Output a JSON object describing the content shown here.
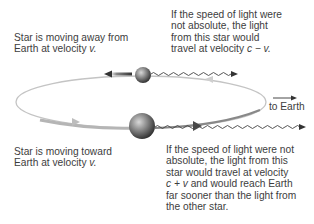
{
  "labels": {
    "away_line1": "Star is moving away from",
    "away_line2": "Earth at velocity ",
    "away_var": "v.",
    "toward_line1": "Star is moving toward",
    "toward_line2": "Earth at velocity ",
    "toward_var": "v.",
    "slow_line1": "If the speed of light were",
    "slow_line2": "not absolute, the light",
    "slow_line3": "from this star would",
    "slow_line4": "travel at velocity ",
    "slow_formula": "c − v.",
    "fast_line1": "If the speed of light were not",
    "fast_line2": "absolute, the light from this",
    "fast_line3": "star would travel at velocity",
    "fast_formula": "c + v",
    "fast_line4": " and would reach Earth",
    "fast_line5": "far sooner than the light from",
    "fast_line6": "the other star.",
    "to_earth": "to Earth"
  },
  "icons": {
    "star_receding": "sphere",
    "star_approaching": "sphere",
    "light_wave": "wavy-arrow",
    "motion_arrow": "arrow",
    "direction_arrow": "arrow-right"
  },
  "colors": {
    "text": "#3d3d3d",
    "orbit": "#b8b8b8",
    "star_dark": "#2a2a2a",
    "star_light": "#b0b0b0",
    "wave": "#444444"
  }
}
